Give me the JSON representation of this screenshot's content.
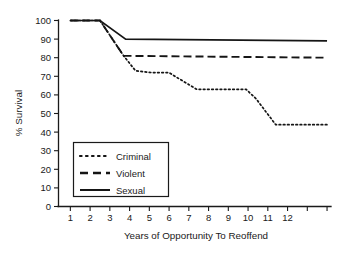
{
  "chart_data": {
    "type": "line",
    "title": "",
    "xlabel": "Years of Opportunity To Reoffend",
    "ylabel": "% Survival",
    "xlim": [
      0.4,
      14.2
    ],
    "ylim": [
      0,
      100
    ],
    "grid": false,
    "legend_position": "inside-lower-left",
    "y_ticks": [
      0,
      10,
      20,
      30,
      40,
      50,
      60,
      70,
      80,
      90,
      100
    ],
    "y_tick_labels": [
      "0",
      "10",
      "20",
      "30",
      "40",
      "50",
      "60",
      "70",
      "80",
      "90",
      "100"
    ],
    "x_ticks": [
      1,
      2,
      3,
      4,
      5,
      6,
      7,
      8,
      9,
      10,
      11,
      12,
      13,
      14
    ],
    "x_tick_labels": [
      "1",
      "2",
      "3",
      "4",
      "5",
      "6",
      "7",
      "8",
      "9",
      "10",
      "11",
      "12",
      "",
      ""
    ],
    "series": [
      {
        "name": "Criminal",
        "style": "dotted",
        "x": [
          1,
          2.5,
          3.7,
          4.3,
          5.1,
          6.0,
          6.3,
          7.4,
          9.9,
          10.4,
          11.4,
          14.0
        ],
        "values": [
          100,
          100,
          81,
          73,
          72,
          72,
          70,
          63,
          63,
          58,
          44,
          44
        ]
      },
      {
        "name": "Violent",
        "style": "dashed",
        "x": [
          1,
          2.5,
          3.7,
          14.0
        ],
        "values": [
          100,
          100,
          81,
          80
        ]
      },
      {
        "name": "Sexual",
        "style": "solid",
        "x": [
          1,
          2.5,
          3.8,
          14.0
        ],
        "values": [
          100,
          100,
          90,
          89
        ]
      }
    ]
  },
  "legend": {
    "entries": [
      {
        "label": "Criminal",
        "style": "dotted"
      },
      {
        "label": "Violent",
        "style": "dashed"
      },
      {
        "label": "Sexual",
        "style": "solid"
      }
    ]
  }
}
